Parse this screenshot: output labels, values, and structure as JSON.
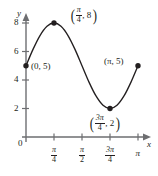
{
  "chart_data": {
    "type": "line",
    "title": "",
    "subtitle": "",
    "xlabel": "x",
    "ylabel": "y",
    "function": "y = 5 + 3 sin(2x)",
    "xlim": [
      0,
      3.14159
    ],
    "ylim": [
      0,
      8.8
    ],
    "grid": false,
    "legend_position": "none",
    "x_tick_labels": [
      "0",
      "π/4",
      "π/2",
      "3π/4",
      "π"
    ],
    "x_tick_values": [
      0,
      0.7854,
      1.5708,
      2.3562,
      3.14159
    ],
    "y_tick_labels": [
      "0",
      "2",
      "4",
      "6",
      "8"
    ],
    "y_tick_values": [
      0,
      2,
      4,
      6,
      8
    ],
    "x": [
      0,
      0.19635,
      0.3927,
      0.58905,
      0.7854,
      0.98175,
      1.1781,
      1.37445,
      1.5708,
      1.76715,
      1.9635,
      2.15985,
      2.3562,
      2.55255,
      2.7489,
      2.94525,
      3.14159
    ],
    "values": [
      5,
      6.148,
      7.121,
      7.772,
      8,
      7.772,
      7.121,
      6.148,
      5,
      3.852,
      2.879,
      2.228,
      2,
      2.228,
      2.879,
      3.852,
      5
    ],
    "points": [
      {
        "label": "(0, 5)",
        "x": 0,
        "y": 5,
        "x_text": "0",
        "y_text": "5",
        "fraction": false
      },
      {
        "label": "(π/4, 8)",
        "x": 0.7854,
        "y": 8,
        "x_num": "π",
        "x_den": "4",
        "y_text": "8",
        "fraction": true
      },
      {
        "label": "(3π/4, 2)",
        "x": 2.3562,
        "y": 2,
        "x_num": "3π",
        "x_den": "4",
        "y_text": "2",
        "fraction": true
      },
      {
        "label": "(π, 5)",
        "x": 3.14159,
        "y": 5,
        "x_text": "π",
        "y_text": "5",
        "fraction": false
      }
    ],
    "colors": {
      "curve": "#231f20",
      "axis": "#6d6e71",
      "point": "#231f20",
      "text": "#231f20",
      "background": "#ffffff"
    }
  },
  "labels": {
    "y_axis_name": "y",
    "x_axis_name": "x",
    "origin": "0",
    "y_tick_8": "8",
    "y_tick_6": "6",
    "y_tick_4": "4",
    "y_tick_2": "2",
    "x_tick_pi4_num": "π",
    "x_tick_pi4_den": "4",
    "x_tick_pi2_num": "π",
    "x_tick_pi2_den": "2",
    "x_tick_3pi4_num": "3π",
    "x_tick_3pi4_den": "4",
    "x_tick_pi": "π",
    "point_0_5": "(0, 5)",
    "point_pi_5": "(π, 5)",
    "peak_open_paren": "(",
    "peak_num": "π",
    "peak_den": "4",
    "peak_rest": ", 8",
    "peak_close_paren": ")",
    "trough_open_paren": "(",
    "trough_num": "3π",
    "trough_den": "4",
    "trough_rest": ", 2",
    "trough_close_paren": ")"
  }
}
